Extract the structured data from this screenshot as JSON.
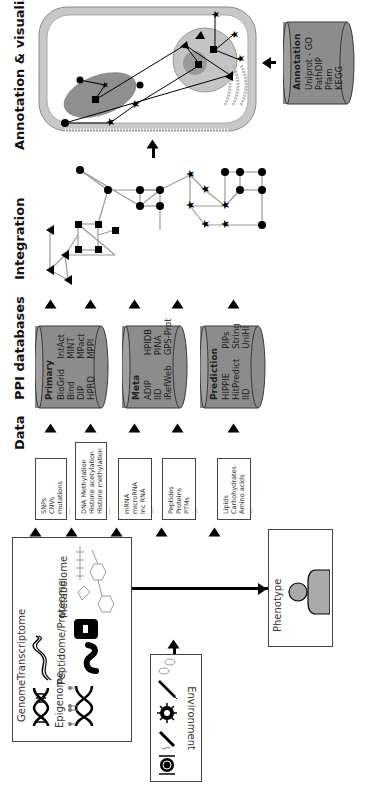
{
  "stages": {
    "data": "Data",
    "ppi": "PPI databases",
    "integration": "Integration",
    "annotation": "Annotation & visualization"
  },
  "environment": {
    "label": "Environment",
    "icons": [
      "plate-cutlery-icon",
      "cigarette-icon",
      "virus-icon",
      "syringe-icon",
      "pills-icon"
    ]
  },
  "omics": {
    "genome": "Genome",
    "epigenome": "Epigenome",
    "transcriptome": "Transcriptome",
    "proteome": "Peptidome/Proteome",
    "metabolome": "Metabolome"
  },
  "phenotype": {
    "label": "Phenotype"
  },
  "data_boxes": [
    {
      "items": [
        "SNPs",
        "CNVs",
        "mutations",
        "..."
      ]
    },
    {
      "items": [
        "DNA Methylation",
        "Histone acetylation",
        "Histone methylation",
        "..."
      ]
    },
    {
      "items": [
        "mRNA",
        "microRNA",
        "lnc RNA",
        "..."
      ]
    },
    {
      "items": [
        "Peptides",
        "Proteins",
        "PTMs",
        "..."
      ]
    },
    {
      "items": [
        "Lipids",
        "Carbohydrates",
        "Amino acids",
        "..."
      ]
    }
  ],
  "databases": {
    "primary": {
      "title": "Primary",
      "col1": [
        "BioGrid",
        "Bind",
        "DIP",
        "HPRD"
      ],
      "col2": [
        "IntAct",
        "MINT",
        "MPact",
        "MPPI"
      ]
    },
    "meta": {
      "title": "Meta",
      "col1": [
        "ADIP",
        "IID",
        "iRefWeb"
      ],
      "col2": [
        "HPIDB",
        "PINA",
        "GPS-Prot"
      ]
    },
    "prediction": {
      "title": "Prediction",
      "col1": [
        "HIPPIE",
        "HitPredict",
        "IID"
      ],
      "col2": [
        "PIPs",
        "String",
        "UniHI"
      ]
    },
    "annotation": {
      "title": "Annotation",
      "items": [
        "Uniprot - GO",
        "PathDIP",
        "Pfam",
        "KEGG"
      ]
    }
  },
  "colors": {
    "cylinder_fill": "#8c8c8c",
    "cylinder_stroke": "#3a3a3a",
    "membrane": "#c8c8c8",
    "mito": "#8f8f8f",
    "nucleus": "#c4c4c4",
    "nucleolus": "#9a9a9a",
    "edge": "#9a9a9a"
  }
}
